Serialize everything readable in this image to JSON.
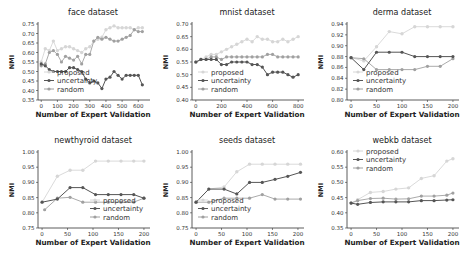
{
  "figure": {
    "colors": {
      "proposed": "#d6d6d6",
      "uncertainty": "#555555",
      "random": "#a0a0a0",
      "axis": "#333333"
    }
  },
  "chart_data": [
    {
      "type": "line",
      "title": "face dataset",
      "xlabel": "Number of Expert Validation",
      "ylabel": "NMI",
      "xlim": [
        -20,
        660
      ],
      "ylim": [
        0.35,
        0.75
      ],
      "xticks": [
        0,
        100,
        200,
        300,
        400,
        500,
        600
      ],
      "yticks": [
        0.35,
        0.4,
        0.45,
        0.5,
        0.55,
        0.6,
        0.65,
        0.7,
        0.75
      ],
      "legend_position": "lower left",
      "legend": [
        "proposed",
        "uncertainty",
        "random"
      ],
      "series": [
        {
          "name": "proposed",
          "x": [
            0,
            25,
            50,
            75,
            100,
            125,
            150,
            175,
            200,
            225,
            250,
            275,
            300,
            325,
            350,
            375,
            400,
            425,
            450,
            475,
            500,
            525,
            550,
            575,
            600,
            625
          ],
          "values": [
            0.55,
            0.62,
            0.61,
            0.66,
            0.61,
            0.62,
            0.63,
            0.63,
            0.62,
            0.61,
            0.6,
            0.62,
            0.63,
            0.66,
            0.67,
            0.68,
            0.72,
            0.73,
            0.74,
            0.73,
            0.73,
            0.73,
            0.73,
            0.72,
            0.73,
            0.73
          ]
        },
        {
          "name": "uncertainty",
          "x": [
            0,
            25,
            50,
            75,
            100,
            125,
            150,
            175,
            200,
            225,
            250,
            275,
            300,
            325,
            350,
            375,
            400,
            425,
            450,
            475,
            500,
            525,
            550,
            575,
            600,
            625
          ],
          "values": [
            0.54,
            0.53,
            0.51,
            0.5,
            0.5,
            0.5,
            0.5,
            0.52,
            0.52,
            0.51,
            0.5,
            0.46,
            0.44,
            0.45,
            0.44,
            0.41,
            0.46,
            0.47,
            0.5,
            0.48,
            0.46,
            0.48,
            0.48,
            0.48,
            0.48,
            0.43
          ]
        },
        {
          "name": "random",
          "x": [
            0,
            25,
            50,
            75,
            100,
            125,
            150,
            175,
            200,
            225,
            250,
            275,
            300,
            325,
            350,
            375,
            400,
            425,
            450,
            475,
            500,
            525,
            550,
            575,
            600,
            625
          ],
          "values": [
            0.53,
            0.54,
            0.6,
            0.61,
            0.59,
            0.55,
            0.58,
            0.57,
            0.56,
            0.58,
            0.54,
            0.59,
            0.59,
            0.66,
            0.68,
            0.67,
            0.68,
            0.67,
            0.66,
            0.66,
            0.67,
            0.68,
            0.69,
            0.72,
            0.71,
            0.71
          ]
        }
      ]
    },
    {
      "type": "line",
      "title": "mnist dataset",
      "xlabel": "Number of Expert Validation",
      "ylabel": "NMI",
      "xlim": [
        -30,
        830
      ],
      "ylim": [
        0.4,
        0.7
      ],
      "xticks": [
        0,
        200,
        400,
        600,
        800
      ],
      "yticks": [
        0.4,
        0.45,
        0.5,
        0.55,
        0.6,
        0.65,
        0.7
      ],
      "legend_position": "lower left",
      "legend": [
        "proposed",
        "uncertainty",
        "random"
      ],
      "series": [
        {
          "name": "proposed",
          "x": [
            0,
            40,
            80,
            120,
            160,
            200,
            240,
            280,
            320,
            360,
            400,
            440,
            480,
            520,
            560,
            600,
            640,
            680,
            720,
            760,
            800
          ],
          "values": [
            0.55,
            0.56,
            0.57,
            0.58,
            0.58,
            0.59,
            0.6,
            0.61,
            0.62,
            0.63,
            0.64,
            0.63,
            0.65,
            0.64,
            0.64,
            0.63,
            0.63,
            0.64,
            0.63,
            0.64,
            0.65
          ]
        },
        {
          "name": "uncertainty",
          "x": [
            0,
            40,
            80,
            120,
            160,
            200,
            240,
            280,
            320,
            360,
            400,
            440,
            480,
            520,
            560,
            600,
            640,
            680,
            720,
            760,
            800
          ],
          "values": [
            0.55,
            0.56,
            0.56,
            0.56,
            0.56,
            0.54,
            0.54,
            0.55,
            0.55,
            0.55,
            0.55,
            0.54,
            0.54,
            0.53,
            0.5,
            0.51,
            0.51,
            0.51,
            0.5,
            0.49,
            0.5
          ]
        },
        {
          "name": "random",
          "x": [
            0,
            40,
            80,
            120,
            160,
            200,
            240,
            280,
            320,
            360,
            400,
            440,
            480,
            520,
            560,
            600,
            640,
            680,
            720,
            760,
            800
          ],
          "values": [
            0.55,
            0.56,
            0.56,
            0.57,
            0.57,
            0.56,
            0.57,
            0.57,
            0.57,
            0.57,
            0.57,
            0.57,
            0.57,
            0.57,
            0.58,
            0.58,
            0.57,
            0.57,
            0.57,
            0.57,
            0.57
          ]
        }
      ]
    },
    {
      "type": "line",
      "title": "derma dataset",
      "xlabel": "Number of Expert Validation",
      "ylabel": "NMI",
      "xlim": [
        -8,
        208
      ],
      "ylim": [
        0.8,
        0.94
      ],
      "xticks": [
        0,
        50,
        100,
        150,
        200
      ],
      "yticks": [
        0.8,
        0.82,
        0.84,
        0.86,
        0.88,
        0.9,
        0.92,
        0.94
      ],
      "legend_position": "lower left",
      "legend": [
        "proposed",
        "uncertainty",
        "random"
      ],
      "series": [
        {
          "name": "proposed",
          "x": [
            0,
            25,
            50,
            75,
            100,
            125,
            150,
            175,
            200
          ],
          "values": [
            0.878,
            0.872,
            0.898,
            0.926,
            0.922,
            0.935,
            0.935,
            0.935,
            0.935
          ]
        },
        {
          "name": "uncertainty",
          "x": [
            0,
            25,
            50,
            75,
            100,
            125,
            150,
            175,
            200
          ],
          "values": [
            0.878,
            0.856,
            0.888,
            0.888,
            0.888,
            0.88,
            0.88,
            0.88,
            0.88
          ]
        },
        {
          "name": "random",
          "x": [
            0,
            25,
            50,
            75,
            100,
            125,
            150,
            175,
            200
          ],
          "values": [
            0.878,
            0.876,
            0.856,
            0.856,
            0.856,
            0.856,
            0.862,
            0.862,
            0.876
          ]
        }
      ]
    },
    {
      "type": "line",
      "title": "newthyroid dataset",
      "xlabel": "Number of Expert Validation",
      "ylabel": "NMI",
      "xlim": [
        -8,
        208
      ],
      "ylim": [
        0.75,
        1.0
      ],
      "xticks": [
        0,
        50,
        100,
        150,
        200
      ],
      "yticks": [
        0.75,
        0.8,
        0.85,
        0.9,
        0.95,
        1.0
      ],
      "legend_position": "lower right",
      "legend": [
        "proposed",
        "uncertainty",
        "random"
      ],
      "series": [
        {
          "name": "proposed",
          "x": [
            0,
            30,
            55,
            80,
            105,
            130,
            155,
            180,
            200
          ],
          "values": [
            0.835,
            0.92,
            0.94,
            0.94,
            0.97,
            0.97,
            0.97,
            0.97,
            0.97
          ]
        },
        {
          "name": "uncertainty",
          "x": [
            0,
            30,
            55,
            80,
            105,
            130,
            155,
            180,
            200
          ],
          "values": [
            0.835,
            0.845,
            0.883,
            0.883,
            0.86,
            0.86,
            0.86,
            0.86,
            0.848
          ]
        },
        {
          "name": "random",
          "x": [
            5,
            30,
            55,
            80,
            105,
            130,
            155,
            180,
            200
          ],
          "values": [
            0.81,
            0.848,
            0.851,
            0.835,
            0.835,
            0.835,
            0.835,
            0.835,
            0.848
          ]
        }
      ]
    },
    {
      "type": "line",
      "title": "seeds dataset",
      "xlabel": "Number of Expert Validation",
      "ylabel": "NMI",
      "xlim": [
        -8,
        208
      ],
      "ylim": [
        0.75,
        1.0
      ],
      "xticks": [
        0,
        50,
        100,
        150,
        200
      ],
      "yticks": [
        0.75,
        0.8,
        0.85,
        0.9,
        0.95,
        1.0
      ],
      "legend_position": "lower left",
      "legend": [
        "proposed",
        "uncertainty",
        "random"
      ],
      "series": [
        {
          "name": "proposed",
          "x": [
            0,
            25,
            55,
            80,
            105,
            130,
            155,
            180,
            205
          ],
          "values": [
            0.835,
            0.878,
            0.885,
            0.935,
            0.96,
            0.96,
            0.96,
            0.96,
            0.96
          ]
        },
        {
          "name": "uncertainty",
          "x": [
            0,
            25,
            55,
            80,
            105,
            130,
            155,
            180,
            205
          ],
          "values": [
            0.835,
            0.878,
            0.878,
            0.862,
            0.9,
            0.9,
            0.91,
            0.92,
            0.933
          ]
        },
        {
          "name": "random",
          "x": [
            0,
            25,
            55,
            80,
            105,
            130,
            155,
            180,
            205
          ],
          "values": [
            0.835,
            0.835,
            0.848,
            0.848,
            0.848,
            0.86,
            0.845,
            0.845,
            0.845
          ]
        }
      ]
    },
    {
      "type": "line",
      "title": "webkb dataset",
      "xlabel": "Number of Expert Validation",
      "ylabel": "NMI",
      "xlim": [
        -8,
        208
      ],
      "ylim": [
        0.35,
        0.6
      ],
      "xticks": [
        0,
        50,
        100,
        150,
        200
      ],
      "yticks": [
        0.35,
        0.4,
        0.45,
        0.5,
        0.55,
        0.6
      ],
      "legend_position": "upper left",
      "legend": [
        "proposed",
        "uncertainty",
        "random"
      ],
      "series": [
        {
          "name": "proposed",
          "x": [
            0,
            13,
            38,
            63,
            88,
            113,
            138,
            163,
            188,
            200
          ],
          "values": [
            0.432,
            0.443,
            0.467,
            0.47,
            0.478,
            0.482,
            0.513,
            0.522,
            0.57,
            0.578
          ]
        },
        {
          "name": "uncertainty",
          "x": [
            0,
            13,
            38,
            63,
            88,
            113,
            138,
            163,
            188,
            200
          ],
          "values": [
            0.432,
            0.428,
            0.434,
            0.436,
            0.436,
            0.436,
            0.44,
            0.44,
            0.442,
            0.443
          ]
        },
        {
          "name": "random",
          "x": [
            0,
            13,
            38,
            63,
            88,
            113,
            138,
            163,
            188,
            200
          ],
          "values": [
            0.432,
            0.44,
            0.447,
            0.448,
            0.445,
            0.446,
            0.455,
            0.455,
            0.458,
            0.465
          ]
        }
      ]
    }
  ]
}
